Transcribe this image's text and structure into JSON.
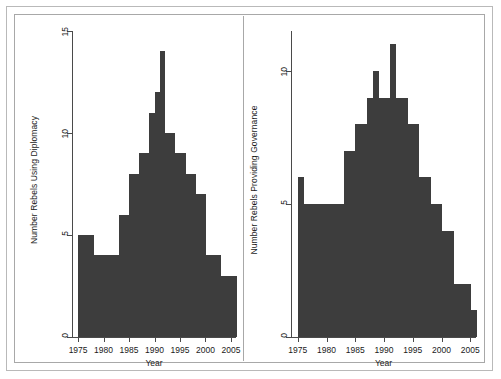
{
  "figure": {
    "panels": [
      {
        "id": "left",
        "ylabel": "Number Rebels Using Diplomacy",
        "xlabel": "Year"
      },
      {
        "id": "right",
        "ylabel": "Number Rebels Providing Governance",
        "xlabel": "Year"
      }
    ]
  },
  "chart_data": [
    {
      "type": "bar",
      "title": "",
      "xlabel": "Year",
      "ylabel": "Number Rebels Using Diplomacy",
      "xlim": [
        1974,
        2006
      ],
      "ylim": [
        0,
        15
      ],
      "yticks": [
        0,
        5,
        10,
        15
      ],
      "xticks": [
        1975,
        1980,
        1985,
        1990,
        1995,
        2000,
        2005
      ],
      "grid": false,
      "legend": null,
      "bar_color": "#3d3d3d",
      "categories": [
        1975,
        1976,
        1977,
        1978,
        1979,
        1980,
        1981,
        1982,
        1983,
        1984,
        1985,
        1986,
        1987,
        1988,
        1989,
        1990,
        1991,
        1992,
        1993,
        1994,
        1995,
        1996,
        1997,
        1998,
        1999,
        2000,
        2001,
        2002,
        2003,
        2004,
        2005
      ],
      "values": [
        5,
        5,
        5,
        4,
        4,
        4,
        4,
        4,
        6,
        6,
        8,
        8,
        9,
        9,
        11,
        12,
        14,
        10,
        10,
        9,
        9,
        8,
        8,
        7,
        7,
        4,
        4,
        4,
        3,
        3,
        3
      ]
    },
    {
      "type": "bar",
      "title": "",
      "xlabel": "Year",
      "ylabel": "Number Rebels Providing Governance",
      "xlim": [
        1974,
        2006
      ],
      "ylim": [
        0,
        11.5
      ],
      "yticks": [
        0,
        5,
        10
      ],
      "xticks": [
        1975,
        1980,
        1985,
        1990,
        1995,
        2000,
        2005
      ],
      "grid": false,
      "legend": null,
      "bar_color": "#3d3d3d",
      "categories": [
        1975,
        1976,
        1977,
        1978,
        1979,
        1980,
        1981,
        1982,
        1983,
        1984,
        1985,
        1986,
        1987,
        1988,
        1989,
        1990,
        1991,
        1992,
        1993,
        1994,
        1995,
        1996,
        1997,
        1998,
        1999,
        2000,
        2001,
        2002,
        2003,
        2004,
        2005
      ],
      "values": [
        6,
        5,
        5,
        5,
        5,
        5,
        5,
        5,
        7,
        7,
        8,
        8,
        9,
        10,
        9,
        9,
        11,
        9,
        9,
        8,
        8,
        6,
        6,
        5,
        5,
        4,
        4,
        2,
        2,
        2,
        1
      ]
    }
  ]
}
